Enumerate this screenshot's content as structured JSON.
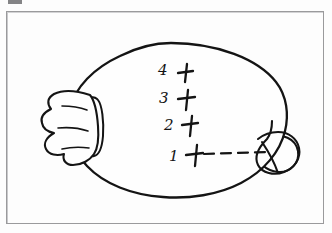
{
  "page": {
    "background_color": "#fdfdfd",
    "ink_color": "#141414",
    "frame_color": "#9a9a9c",
    "artifact_color": "#6f6f71"
  },
  "figure": {
    "kind": "hand-drawn line illustration",
    "body_shape": "oval",
    "knot_position": "left",
    "nozzle_loop_position": "right",
    "gather_line_count": 3
  },
  "annotations": {
    "rows": [
      {
        "number": "4",
        "mark": "+",
        "has_dashed_line": false
      },
      {
        "number": "3",
        "mark": "+",
        "has_dashed_line": false
      },
      {
        "number": "2",
        "mark": "+",
        "has_dashed_line": false
      },
      {
        "number": "1",
        "mark": "+",
        "has_dashed_line": true
      }
    ],
    "dash_count": 5
  }
}
